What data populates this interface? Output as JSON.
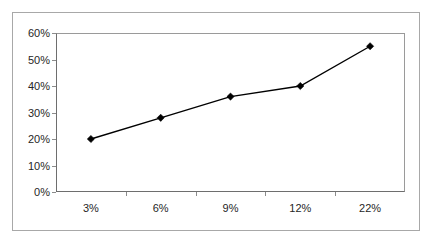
{
  "chart_data": {
    "type": "line",
    "title": "",
    "subtitle": "",
    "xlabel": "",
    "ylabel": "",
    "categories": [
      "3%",
      "6%",
      "9%",
      "12%",
      "22%"
    ],
    "values": [
      20,
      28,
      36,
      40,
      55
    ],
    "value_labels": [
      "20%",
      "28%",
      "36%",
      "40%",
      "55%"
    ],
    "series": [
      {
        "name": "Series 1",
        "values": [
          20,
          28,
          36,
          40,
          55
        ],
        "marker": "diamond",
        "color": "#000000"
      }
    ],
    "ylim": [
      0,
      60
    ],
    "y_ticks": [
      0,
      10,
      20,
      30,
      40,
      50,
      60
    ],
    "y_tick_labels": [
      "0%",
      "10%",
      "20%",
      "30%",
      "40%",
      "50%",
      "60%"
    ],
    "x_tick_labels": [
      "3%",
      "6%",
      "9%",
      "12%",
      "22%"
    ],
    "grid": false,
    "legend": false,
    "legend_position": "none",
    "annotations": []
  },
  "colors": {
    "series_line": "#000000",
    "marker": "#000000",
    "axis": "#6e6e6e",
    "plot_border": "#9a9a9a",
    "outer_border": "#a8a8a8",
    "tick_text": "#262626",
    "background": "#ffffff"
  }
}
